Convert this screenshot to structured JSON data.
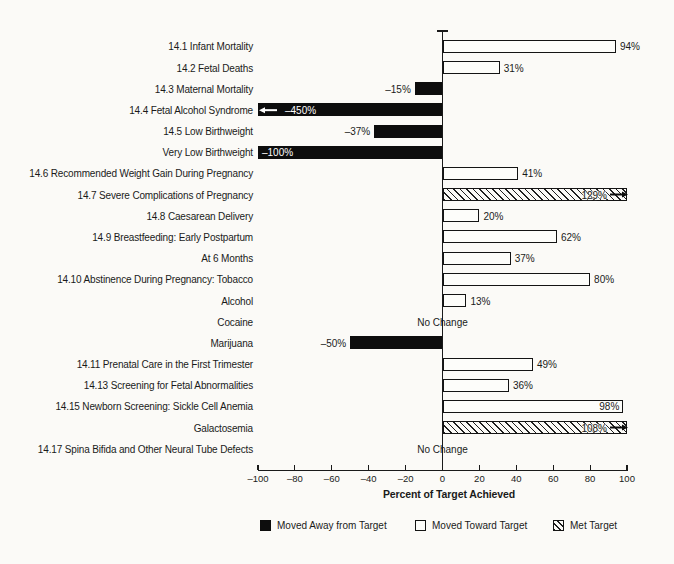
{
  "figure": {
    "background": "#fbfaf7",
    "ink": "#1a1a1a"
  },
  "chart_data": {
    "type": "bar",
    "orientation": "horizontal",
    "xlabel": "Percent of Target Achieved",
    "xlim": [
      -100,
      100
    ],
    "grid": false,
    "legend_position": "bottom",
    "xticks": [
      {
        "v": -100,
        "label": "–100"
      },
      {
        "v": -80,
        "label": "–80"
      },
      {
        "v": -60,
        "label": "–60"
      },
      {
        "v": -40,
        "label": "–40"
      },
      {
        "v": -20,
        "label": "–20"
      },
      {
        "v": 0,
        "label": "0"
      },
      {
        "v": 20,
        "label": "20"
      },
      {
        "v": 40,
        "label": "40"
      },
      {
        "v": 60,
        "label": "60"
      },
      {
        "v": 80,
        "label": "80"
      },
      {
        "v": 100,
        "label": "100"
      }
    ],
    "legend": [
      {
        "style": "away",
        "label": "Moved Away from Target"
      },
      {
        "style": "toward",
        "label": "Moved Toward Target"
      },
      {
        "style": "met",
        "label": "Met Target"
      }
    ],
    "rows": [
      {
        "label": "14.1 Infant Mortality",
        "value": 94,
        "display": "94%",
        "category": "toward"
      },
      {
        "label": "14.2 Fetal Deaths",
        "value": 31,
        "display": "31%",
        "category": "toward"
      },
      {
        "label": "14.3 Maternal Mortality",
        "value": -15,
        "display": "–15%",
        "category": "away"
      },
      {
        "label": "14.4 Fetal Alcohol Syndrome",
        "value": -450,
        "display": "–450%",
        "category": "away",
        "clipped": true,
        "arrow": "left"
      },
      {
        "label": "14.5 Low Birthweight",
        "value": -37,
        "display": "–37%",
        "category": "away"
      },
      {
        "label": "Very Low Birthweight",
        "value": -100,
        "display": "–100%",
        "category": "away",
        "label_inside": true
      },
      {
        "label": "14.6 Recommended Weight Gain During Pregnancy",
        "value": 41,
        "display": "41%",
        "category": "toward"
      },
      {
        "label": "14.7 Severe Complications of Pregnancy",
        "value": 129,
        "display": "129%",
        "category": "met",
        "clipped": true,
        "arrow": "right"
      },
      {
        "label": "14.8 Caesarean Delivery",
        "value": 20,
        "display": "20%",
        "category": "toward"
      },
      {
        "label": "14.9 Breastfeeding: Early Postpartum",
        "value": 62,
        "display": "62%",
        "category": "toward"
      },
      {
        "label": "At 6 Months",
        "value": 37,
        "display": "37%",
        "category": "toward"
      },
      {
        "label": "14.10 Abstinence During Pregnancy: Tobacco",
        "value": 80,
        "display": "80%",
        "category": "toward"
      },
      {
        "label": "Alcohol",
        "value": 13,
        "display": "13%",
        "category": "toward"
      },
      {
        "label": "Cocaine",
        "value": null,
        "display": "No Change",
        "category": "no-change"
      },
      {
        "label": "Marijuana",
        "value": -50,
        "display": "–50%",
        "category": "away"
      },
      {
        "label": "14.11 Prenatal Care in the First Trimester",
        "value": 49,
        "display": "49%",
        "category": "toward"
      },
      {
        "label": "14.13 Screening for Fetal Abnormalities",
        "value": 36,
        "display": "36%",
        "category": "toward"
      },
      {
        "label": "14.15 Newborn Screening: Sickle Cell Anemia",
        "value": 98,
        "display": "98%",
        "category": "toward",
        "label_inside": true
      },
      {
        "label": "Galactosemia",
        "value": 108,
        "display": "108%",
        "category": "met",
        "clipped": true,
        "arrow": "right"
      },
      {
        "label": "14.17 Spina Bifida and Other Neural Tube Defects",
        "value": null,
        "display": "No Change",
        "category": "no-change"
      }
    ]
  }
}
